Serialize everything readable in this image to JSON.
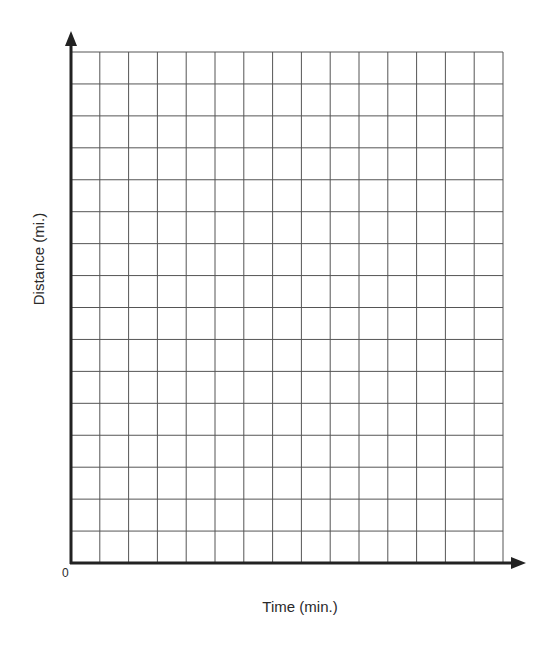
{
  "chart_data": {
    "type": "line",
    "title": "",
    "xlabel": "Time (min.)",
    "ylabel": "Distance (mi.)",
    "origin_label": "0",
    "grid": true,
    "grid_columns": 15,
    "grid_rows": 16,
    "series": [],
    "x": [],
    "xlim": [
      0,
      15
    ],
    "ylim": [
      0,
      16
    ],
    "legend": null,
    "note": "Blank graph paper with labeled axes; no data plotted"
  },
  "colors": {
    "grid_line": "#555555",
    "axis_line": "#222222",
    "background": "#ffffff"
  }
}
